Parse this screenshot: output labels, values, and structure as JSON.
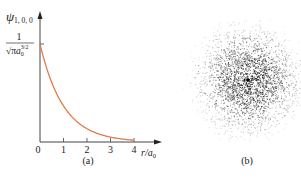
{
  "figure": {
    "panel_a": {
      "caption": "(a)",
      "y_label_main": "ψ",
      "y_label_sub": "1, 0, 0",
      "y_tick_numerator": "1",
      "y_tick_denominator_sqrt": "√π",
      "y_tick_denominator_a": "a",
      "y_tick_denominator_sub": "0",
      "y_tick_denominator_sup": "3/2",
      "x_label": "r/a",
      "x_label_sub": "0",
      "x_ticks": [
        "0",
        "1",
        "2",
        "3",
        "4"
      ],
      "curve_color": "#e07a4a"
    },
    "panel_b": {
      "caption": "(b)",
      "description": "electron probability density cloud (1s orbital)"
    }
  },
  "chart_data": {
    "type": "line",
    "title": "",
    "xlabel": "r/a0",
    "ylabel": "ψ1,0,0",
    "x": [
      0,
      0.5,
      1,
      1.5,
      2,
      2.5,
      3,
      3.5,
      4
    ],
    "series": [
      {
        "name": "ψ1,0,0 = (1/√π a0^3/2) e^(-r/a0)",
        "values": [
          1.0,
          0.61,
          0.37,
          0.22,
          0.14,
          0.08,
          0.05,
          0.03,
          0.02
        ]
      }
    ],
    "x_ticks": [
      "0",
      "1",
      "2",
      "3",
      "4"
    ],
    "y_ticks": [
      "1/(√π a0^3/2)"
    ],
    "xlim": [
      0,
      5
    ],
    "ylim": [
      0,
      1.3
    ],
    "grid": false
  }
}
